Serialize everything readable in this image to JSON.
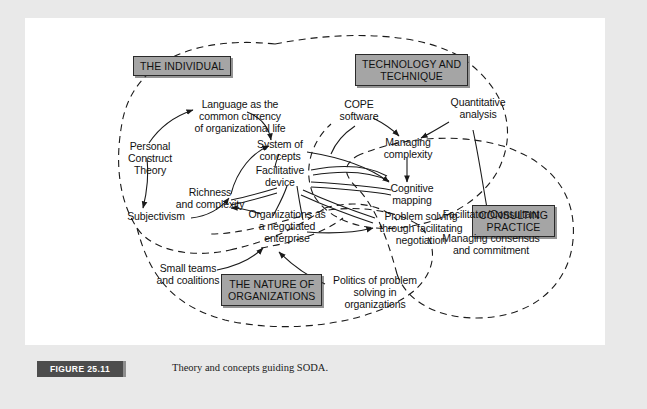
{
  "figure": {
    "number_label": "FIGURE 25.11",
    "caption": "Theory and concepts guiding SODA.",
    "background_color": "#e9e9e9",
    "panel_color": "#ffffff",
    "header_box_color": "#a5a5a5",
    "line_color": "#1a1a1a"
  },
  "headers": [
    {
      "id": "individual",
      "label": "THE INDIVIDUAL"
    },
    {
      "id": "technology",
      "label": "TECHNOLOGY AND\nTECHNIQUE"
    },
    {
      "id": "organizations",
      "label": "THE NATURE OF\nORGANIZATIONS"
    },
    {
      "id": "consulting",
      "label": "CONSULTING\nPRACTICE"
    }
  ],
  "nodes": [
    {
      "id": "language",
      "label": "Language as the\ncommon currency\nof organizational life"
    },
    {
      "id": "personal",
      "label": "Personal\nConstruct\nTheory"
    },
    {
      "id": "system",
      "label": "System of\nconcepts"
    },
    {
      "id": "facilitative",
      "label": "Facilitative\ndevice"
    },
    {
      "id": "richness",
      "label": "Richness\nand complexity"
    },
    {
      "id": "subjectivism",
      "label": "Subjectivism"
    },
    {
      "id": "organizations",
      "label": "Organizations as\na negotiated\nenterprise"
    },
    {
      "id": "smallteams",
      "label": "Small teams\nand coalitions"
    },
    {
      "id": "politics",
      "label": "Politics of problem\nsolving in\norganizations"
    },
    {
      "id": "cope",
      "label": "COPE\nsoftware"
    },
    {
      "id": "managingcomplex",
      "label": "Managing\ncomplexity"
    },
    {
      "id": "quantitative",
      "label": "Quantitative\nanalysis"
    },
    {
      "id": "cognitive",
      "label": "Cognitive\nmapping"
    },
    {
      "id": "problemsolving",
      "label": "Problem solving\nthrough facilitating\nnegotiation"
    },
    {
      "id": "facilitator",
      "label": "Facilitator/Consultant"
    },
    {
      "id": "consensus",
      "label": "Managing consensus\nand commitment"
    }
  ]
}
